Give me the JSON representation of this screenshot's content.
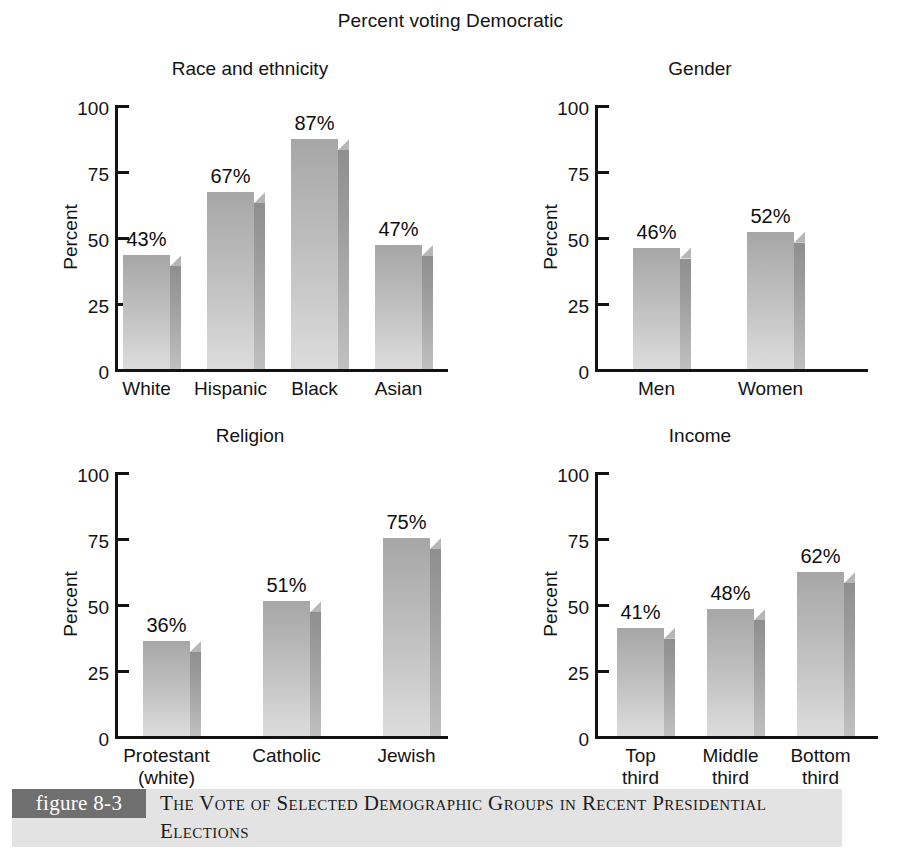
{
  "figure": {
    "title": "Percent voting Democratic",
    "ylabel": "Percent",
    "yticks": [
      "100",
      "75",
      "50",
      "25",
      "0"
    ]
  },
  "caption": {
    "tag": "figure 8-3",
    "text": "The Vote of Selected Demographic Groups in Recent Presidential Elections"
  },
  "chart_data": [
    {
      "type": "bar",
      "title": "Race and ethnicity",
      "xlabel": "",
      "ylabel": "Percent",
      "ylim": [
        0,
        100
      ],
      "yticks": [
        0,
        25,
        50,
        75,
        100
      ],
      "grid": false,
      "legend": "none",
      "categories": [
        "White",
        "Hispanic",
        "Black",
        "Asian"
      ],
      "values": [
        43,
        67,
        87,
        47
      ],
      "datalabels": [
        "43%",
        "67%",
        "87%",
        "47%"
      ]
    },
    {
      "type": "bar",
      "title": "Gender",
      "xlabel": "",
      "ylabel": "Percent",
      "ylim": [
        0,
        100
      ],
      "yticks": [
        0,
        25,
        50,
        75,
        100
      ],
      "grid": false,
      "legend": "none",
      "categories": [
        "Men",
        "Women"
      ],
      "values": [
        46,
        52
      ],
      "datalabels": [
        "46%",
        "52%"
      ]
    },
    {
      "type": "bar",
      "title": "Religion",
      "xlabel": "",
      "ylabel": "Percent",
      "ylim": [
        0,
        100
      ],
      "yticks": [
        0,
        25,
        50,
        75,
        100
      ],
      "grid": false,
      "legend": "none",
      "categories": [
        "Protestant\n(white)",
        "Catholic",
        "Jewish"
      ],
      "values": [
        36,
        51,
        75
      ],
      "datalabels": [
        "36%",
        "51%",
        "75%"
      ]
    },
    {
      "type": "bar",
      "title": "Income",
      "xlabel": "",
      "ylabel": "Percent",
      "ylim": [
        0,
        100
      ],
      "yticks": [
        0,
        25,
        50,
        75,
        100
      ],
      "grid": false,
      "legend": "none",
      "categories": [
        "Top\nthird",
        "Middle\nthird",
        "Bottom\nthird"
      ],
      "values": [
        41,
        48,
        62
      ],
      "datalabels": [
        "41%",
        "48%",
        "62%"
      ]
    }
  ],
  "panel_layout": [
    {
      "left": 40,
      "top": 58,
      "width": 420,
      "height": 350,
      "plot_left": 75,
      "plot_top": 47,
      "plot_width": 330,
      "plot_height": 264,
      "bar_width": 47,
      "bar_gap": 26,
      "bar_start": 8
    },
    {
      "left": 500,
      "top": 58,
      "width": 400,
      "height": 350,
      "plot_left": 95,
      "plot_top": 47,
      "plot_width": 270,
      "plot_height": 264,
      "bar_width": 47,
      "bar_gap": 56,
      "bar_start": 38
    },
    {
      "left": 40,
      "top": 425,
      "width": 420,
      "height": 360,
      "plot_left": 75,
      "plot_top": 47,
      "plot_width": 330,
      "plot_height": 264,
      "bar_width": 47,
      "bar_gap": 62,
      "bar_start": 28
    },
    {
      "left": 500,
      "top": 425,
      "width": 400,
      "height": 360,
      "plot_left": 95,
      "plot_top": 47,
      "plot_width": 280,
      "plot_height": 264,
      "bar_width": 47,
      "bar_gap": 32,
      "bar_start": 22
    }
  ]
}
